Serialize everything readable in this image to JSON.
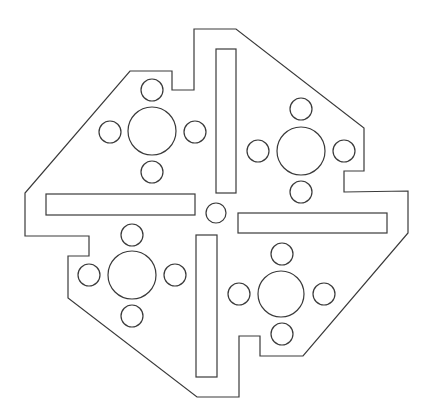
{
  "diagram": {
    "kind": "mechanical plate outline",
    "stroke": "#3a3a3a",
    "background": "#ffffff",
    "outline": "194,29 236,29 364,128 364,171 344,171 344,192 408,191 408,233 303,356 260,356 260,336 239,336 239,397 197,397 68,298 68,256 89,256 89,236 25,236 25,193 130,71 172,71 172,90 194,90",
    "slots": [
      {
        "name": "slot-top",
        "x": 216,
        "y": 49,
        "w": 20,
        "h": 144
      },
      {
        "name": "slot-left",
        "x": 46,
        "y": 194,
        "w": 149,
        "h": 21
      },
      {
        "name": "slot-right",
        "x": 238,
        "y": 213,
        "w": 149,
        "h": 20
      },
      {
        "name": "slot-bottom",
        "x": 196,
        "y": 235,
        "w": 21,
        "h": 142
      }
    ],
    "center_hole": {
      "cx": 216,
      "cy": 213,
      "r": 10
    },
    "hole_groups": [
      {
        "name": "top-left",
        "cx": 152,
        "cy": 131,
        "r": 24,
        "small": [
          [
            152,
            90
          ],
          [
            110,
            132
          ],
          [
            195,
            132
          ],
          [
            152,
            172
          ]
        ]
      },
      {
        "name": "top-right",
        "cx": 301,
        "cy": 151,
        "r": 24,
        "small": [
          [
            301,
            109
          ],
          [
            258,
            151
          ],
          [
            344,
            151
          ],
          [
            301,
            192
          ]
        ]
      },
      {
        "name": "bottom-left",
        "cx": 132,
        "cy": 275,
        "r": 24,
        "small": [
          [
            132,
            235
          ],
          [
            89,
            275
          ],
          [
            175,
            275
          ],
          [
            132,
            316
          ]
        ]
      },
      {
        "name": "bottom-right",
        "cx": 281,
        "cy": 294,
        "r": 23,
        "small": [
          [
            282,
            254
          ],
          [
            239,
            294
          ],
          [
            324,
            294
          ],
          [
            282,
            334
          ]
        ]
      }
    ],
    "small_r": 11
  }
}
